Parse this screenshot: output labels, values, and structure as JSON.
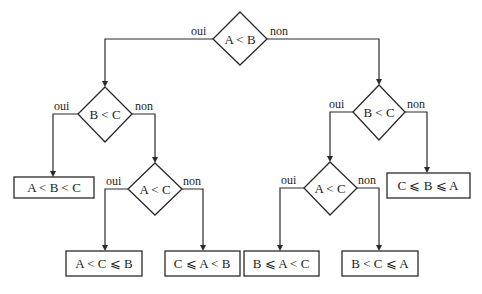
{
  "diagram": {
    "type": "decision-tree",
    "branch_labels": {
      "yes": "oui",
      "no": "non"
    },
    "decisions": [
      {
        "id": "d1",
        "condition": "A < B",
        "yes": "d2",
        "no": "d3"
      },
      {
        "id": "d2",
        "condition": "B < C",
        "yes": "r1",
        "no": "d4"
      },
      {
        "id": "d3",
        "condition": "B < C",
        "yes": "d5",
        "no": "r4"
      },
      {
        "id": "d4",
        "condition": "A < C",
        "yes": "r2",
        "no": "r3"
      },
      {
        "id": "d5",
        "condition": "A < C",
        "yes": "r5",
        "no": "r6"
      }
    ],
    "results": [
      {
        "id": "r1",
        "text": "A < B < C"
      },
      {
        "id": "r2",
        "text": "A < C ⩽ B"
      },
      {
        "id": "r3",
        "text": "C ⩽ A < B"
      },
      {
        "id": "r4",
        "text": "C ⩽ B ⩽ A"
      },
      {
        "id": "r5",
        "text": "B ⩽ A < C"
      },
      {
        "id": "r6",
        "text": "B < C ⩽ A"
      }
    ]
  }
}
